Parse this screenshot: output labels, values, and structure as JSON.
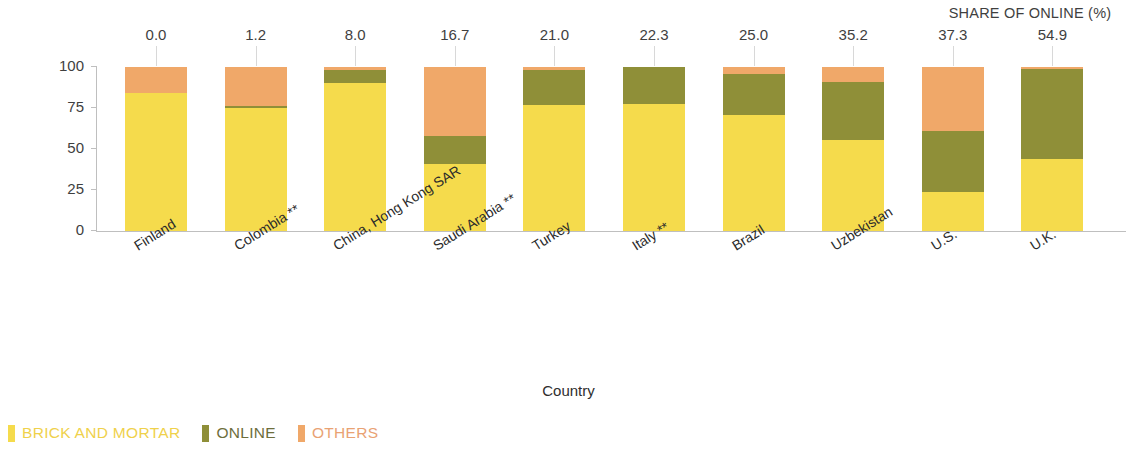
{
  "chart_data": {
    "type": "bar",
    "subtype": "stacked-100-percent",
    "title": "",
    "xlabel": "Country",
    "ylabel": "Distribution of copies sold by the trade sector (%)",
    "ylim": [
      0,
      100
    ],
    "yticks": [
      0,
      25,
      50,
      75,
      100
    ],
    "ytick_labels": [
      "0",
      "25",
      "50",
      "75",
      "100"
    ],
    "grid": false,
    "legend_position": "bottom-left",
    "categories": [
      "Finland",
      "Colombia **",
      "China, Hong Kong SAR",
      "Saudi Arabia **",
      "Turkey",
      "Italy **",
      "Brazil",
      "Uzbekistan",
      "U.S.",
      "U.K."
    ],
    "series": [
      {
        "name": "BRICK AND MORTAR",
        "color": "#F5DB4C",
        "values": [
          84.0,
          74.8,
          90.0,
          41.0,
          77.0,
          77.7,
          71.0,
          55.8,
          23.8,
          44.1
        ]
      },
      {
        "name": "ONLINE",
        "color": "#8F8F38",
        "values": [
          0.0,
          1.2,
          8.0,
          16.7,
          21.0,
          22.3,
          25.0,
          35.2,
          37.3,
          54.9
        ]
      },
      {
        "name": "OTHERS",
        "color": "#F0A869",
        "values": [
          16.0,
          24.0,
          2.0,
          42.3,
          2.0,
          0.0,
          4.0,
          9.0,
          38.9,
          1.0
        ]
      }
    ],
    "annotation_header": "SHARE OF ONLINE (%)",
    "annotation_values": [
      "0.0",
      "1.2",
      "8.0",
      "16.7",
      "21.0",
      "22.3",
      "25.0",
      "35.2",
      "37.3",
      "54.9"
    ]
  },
  "legend": {
    "items": [
      {
        "label": "BRICK AND MORTAR",
        "color": "#F5DB4C",
        "text_color": "#EFD14B"
      },
      {
        "label": "ONLINE",
        "color": "#8F8F38",
        "text_color": "#6E6E3C"
      },
      {
        "label": "OTHERS",
        "color": "#F0A869",
        "text_color": "#E9A273"
      }
    ]
  }
}
